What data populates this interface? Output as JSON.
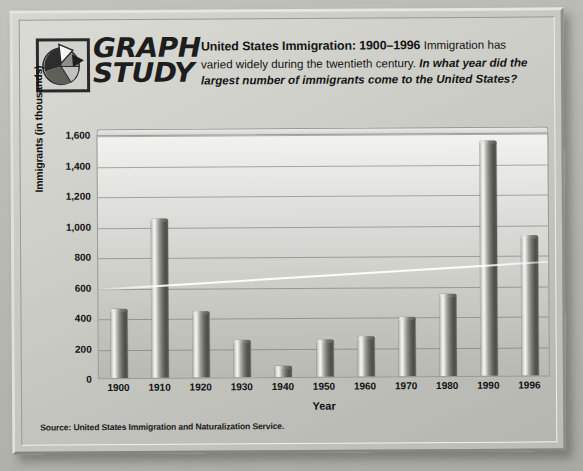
{
  "logo": {
    "icon": "pie-chart-icon",
    "line1": "GRAPH",
    "line2": "STUDY"
  },
  "header": {
    "title": "United States Immigration: 1900–1996",
    "lead": "Immigration has varied widely during the twentieth century.",
    "question": "In what year did the largest number of immigrants come to the United States?"
  },
  "source": "Source: United States Immigration and Naturalization Service.",
  "colors": {
    "page_background": "#b9b9b4",
    "frame_face": "#cfcfc9",
    "plot_background": "#d3d3ce",
    "bar_dark": "#4e4e49",
    "bar_light": "#f3f3f0",
    "gridline": "#6e6e69",
    "text": "#111111"
  },
  "chart_data": {
    "type": "bar",
    "title": "United States Immigration: 1900–1996",
    "xlabel": "Year",
    "ylabel": "Immigrants (in thousands)",
    "categories": [
      "1900",
      "1910",
      "1920",
      "1930",
      "1940",
      "1950",
      "1960",
      "1970",
      "1980",
      "1990",
      "1996"
    ],
    "values": [
      450,
      1040,
      430,
      240,
      70,
      240,
      265,
      385,
      540,
      1540,
      915
    ],
    "ylim": [
      0,
      1600
    ],
    "yticks": [
      0,
      200,
      400,
      600,
      800,
      1000,
      1200,
      1400,
      1600
    ],
    "ytick_labels": [
      "0",
      "200",
      "400",
      "600",
      "800",
      "1,000",
      "1,200",
      "1,400",
      "1,600"
    ],
    "grid": true,
    "legend": "none",
    "units": "thousands of immigrants",
    "max_category": "1990",
    "min_category": "1940"
  }
}
